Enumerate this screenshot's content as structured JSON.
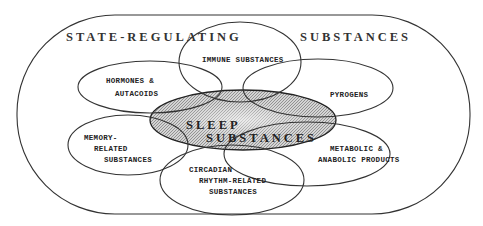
{
  "diagram": {
    "outer_title_left": "STATE-REGULATING",
    "outer_title_right": "SUBSTANCES",
    "center": {
      "line1": "SLEEP",
      "line2": "SUBSTANCES",
      "fill_pattern": "hatched-gray"
    },
    "sets": [
      {
        "id": "immune",
        "lines": [
          "IMMUNE SUBSTANCES"
        ]
      },
      {
        "id": "hormones",
        "lines": [
          "HORMONES &",
          "AUTACOIDS"
        ]
      },
      {
        "id": "pyrogens",
        "lines": [
          "PYROGENS"
        ]
      },
      {
        "id": "memory",
        "lines": [
          "MEMORY-",
          "RELATED",
          "SUBSTANCES"
        ]
      },
      {
        "id": "metabolic",
        "lines": [
          "METABOLIC &",
          "ANABOLIC PRODUCTS"
        ]
      },
      {
        "id": "circadian",
        "lines": [
          "CIRCADIAN",
          "RHYTHM-RELATED",
          "SUBSTANCES"
        ]
      }
    ],
    "colors": {
      "line": "#333333",
      "center_fill": "#b8b8b8",
      "background": "#ffffff"
    }
  }
}
